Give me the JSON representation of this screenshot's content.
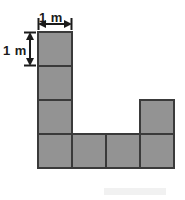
{
  "figure": {
    "unit_label": "1 m",
    "width_label": "1 m",
    "height_label": "1 m",
    "colors": {
      "fill": "#939393",
      "stroke": "#3a3a3a",
      "background": "#ffffff",
      "label": "#1b1b1b",
      "artifact": "#f1f1f1"
    }
  },
  "chart_data": {
    "type": "table",
    "xlabel": "1 m",
    "ylabel": "1 m",
    "grid": {
      "cell_size_m": 1,
      "cell_size_px": 34,
      "origin_px": [
        38,
        32
      ],
      "columns": 4,
      "rows": 4
    },
    "cells": [
      {
        "col": 0,
        "row": 0,
        "filled": true
      },
      {
        "col": 1,
        "row": 0,
        "filled": false
      },
      {
        "col": 2,
        "row": 0,
        "filled": false
      },
      {
        "col": 3,
        "row": 0,
        "filled": false
      },
      {
        "col": 0,
        "row": 1,
        "filled": true
      },
      {
        "col": 1,
        "row": 1,
        "filled": false
      },
      {
        "col": 2,
        "row": 1,
        "filled": false
      },
      {
        "col": 3,
        "row": 1,
        "filled": false
      },
      {
        "col": 0,
        "row": 2,
        "filled": true
      },
      {
        "col": 1,
        "row": 2,
        "filled": false
      },
      {
        "col": 2,
        "row": 2,
        "filled": false
      },
      {
        "col": 3,
        "row": 2,
        "filled": true
      },
      {
        "col": 0,
        "row": 3,
        "filled": true
      },
      {
        "col": 1,
        "row": 3,
        "filled": true
      },
      {
        "col": 2,
        "row": 3,
        "filled": true
      },
      {
        "col": 3,
        "row": 3,
        "filled": true
      }
    ],
    "filled_count": 8,
    "categories": [
      "row 0",
      "row 1",
      "row 2",
      "row 3"
    ],
    "values": [
      1,
      1,
      2,
      4
    ],
    "annotations": [
      "1 m",
      "1 m"
    ],
    "legend": []
  },
  "dimensions": {
    "width_arrow": {
      "label": "1 m",
      "from_px": [
        38,
        24
      ],
      "to_px": [
        72,
        24
      ]
    },
    "height_arrow": {
      "label": "1 m",
      "from_px": [
        30,
        32
      ],
      "to_px": [
        30,
        66
      ]
    }
  }
}
